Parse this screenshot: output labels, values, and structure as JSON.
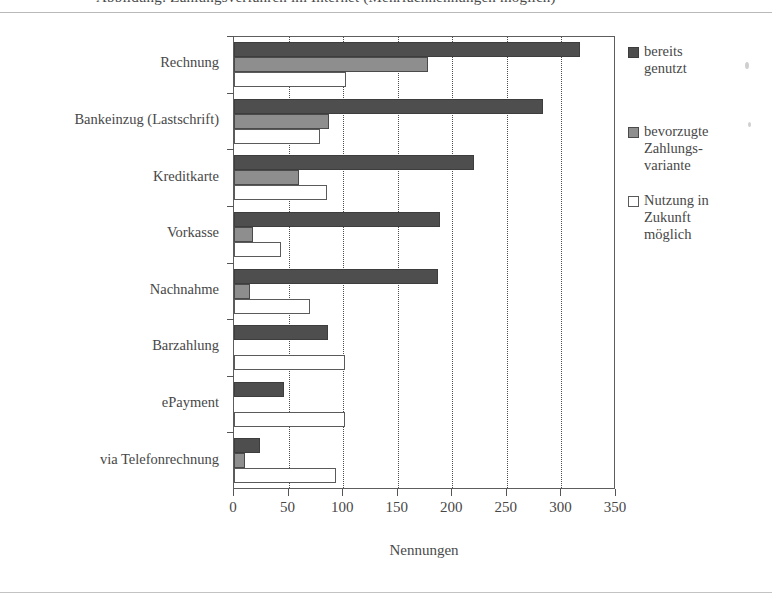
{
  "figure": {
    "clipped_title": "Abbildung: Zahlungsverfahren im Internet (Mehrfachnennungen möglich)",
    "xaxis_title": "Nennungen"
  },
  "legend": {
    "entries": [
      {
        "label": "bereits\ngenutzt",
        "color": "#4e4e4e",
        "key": "k0"
      },
      {
        "label": "bevorzugte\nZahlungs-\nvariante",
        "color": "#8e8e8e",
        "key": "k1"
      },
      {
        "label": "Nutzung in\nZukunft\nmöglich",
        "color": "#ffffff",
        "key": "k2"
      }
    ]
  },
  "chart_data": {
    "type": "bar",
    "orientation": "horizontal",
    "title": "Abbildung: Zahlungsverfahren im Internet (Mehrfachnennungen möglich)",
    "xlabel": "Nennungen",
    "ylabel": "",
    "xlim": [
      0,
      350
    ],
    "xticks": [
      0,
      50,
      100,
      150,
      200,
      250,
      300,
      350
    ],
    "grid": "vertical-dotted",
    "legend_position": "right",
    "categories": [
      "Rechnung",
      "Bankeinzug (Lastschrift)",
      "Kreditkarte",
      "Vorkasse",
      "Nachnahme",
      "Barzahlung",
      "ePayment",
      "via Telefonrechnung"
    ],
    "series": [
      {
        "name": "bereits genutzt",
        "color": "#4e4e4e",
        "values": [
          317,
          283,
          220,
          189,
          187,
          86,
          46,
          24
        ]
      },
      {
        "name": "bevorzugte Zahlungsvariante",
        "color": "#8e8e8e",
        "values": [
          178,
          87,
          60,
          17,
          15,
          0,
          0,
          10
        ]
      },
      {
        "name": "Nutzung in Zukunft möglich",
        "color": "#ffffff",
        "values": [
          103,
          79,
          85,
          43,
          70,
          102,
          102,
          93
        ]
      }
    ]
  }
}
